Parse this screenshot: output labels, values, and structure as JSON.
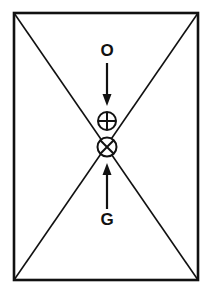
{
  "figure": {
    "canvas": {
      "width": 212,
      "height": 295,
      "background": "#ffffff"
    },
    "stroke_color": "#111111",
    "rectangle": {
      "name": "boundary-rectangle",
      "left": 14,
      "top": 13,
      "right": 198,
      "bottom": 280,
      "stroke_width": 2.6
    },
    "diagonals": {
      "name": "rectangle-diagonals",
      "stroke_width": 1.6,
      "lines": [
        {
          "x1": 14,
          "y1": 13,
          "x2": 198,
          "y2": 280
        },
        {
          "x1": 198,
          "y1": 13,
          "x2": 14,
          "y2": 280
        }
      ]
    },
    "center": {
      "x": 107,
      "y": 147
    },
    "labels": [
      {
        "id": "label-o",
        "text": "O",
        "x": 107,
        "y": 52
      },
      {
        "id": "label-g",
        "text": "G",
        "x": 107,
        "y": 221
      }
    ],
    "arrows": [
      {
        "id": "arrow-down",
        "direction": "down",
        "x": 107,
        "y_start": 63,
        "y_end": 106,
        "shaft_width": 2.2,
        "head_width": 9,
        "head_length": 12
      },
      {
        "id": "arrow-up",
        "direction": "up",
        "x": 107,
        "y_start": 209,
        "y_end": 163,
        "shaft_width": 2.2,
        "head_width": 9,
        "head_length": 12
      }
    ],
    "symbols": [
      {
        "id": "symbol-circle-plus",
        "glyph": "circled-plus",
        "cx": 107,
        "cy": 121,
        "r": 9,
        "stroke_width": 2.0
      },
      {
        "id": "symbol-circle-cross",
        "glyph": "circled-cross",
        "cx": 107,
        "cy": 147,
        "r": 9.5,
        "stroke_width": 2.0
      }
    ]
  }
}
